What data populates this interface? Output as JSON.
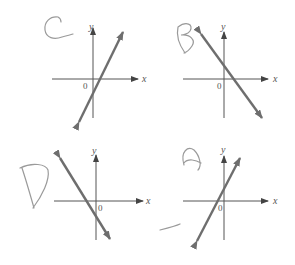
{
  "graphs": [
    {
      "id": "C",
      "handwritten_label": "C",
      "x_label": "x",
      "y_label": "y",
      "origin_label": "0",
      "slope": "positive",
      "y_intercept": "negative",
      "line_color": "#6e6e6e"
    },
    {
      "id": "B",
      "handwritten_label": "B",
      "x_label": "x",
      "y_label": "y",
      "origin_label": "0",
      "slope": "negative",
      "y_intercept": "positive",
      "line_color": "#6e6e6e"
    },
    {
      "id": "D",
      "handwritten_label": "D",
      "x_label": "x",
      "y_label": "y",
      "origin_label": "0",
      "slope": "negative",
      "y_intercept": "negative",
      "line_color": "#6e6e6e"
    },
    {
      "id": "A",
      "handwritten_label": "A",
      "x_label": "x",
      "y_label": "y",
      "origin_label": "0",
      "slope": "positive",
      "y_intercept": "positive",
      "line_color": "#6e6e6e"
    }
  ]
}
